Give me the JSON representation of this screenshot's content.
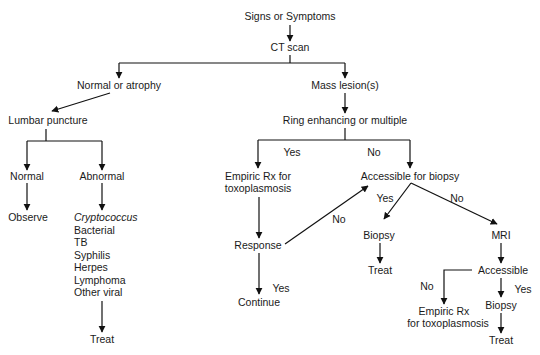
{
  "diagram": {
    "type": "flowchart",
    "nodes": {
      "start": "Signs or Symptoms",
      "ct": "CT scan",
      "normal_atrophy": "Normal or atrophy",
      "mass": "Mass lesion(s)",
      "lp": "Lumbar puncture",
      "lp_normal": "Normal",
      "lp_abnormal": "Abnormal",
      "observe": "Observe",
      "causes": [
        "Cryptococcus",
        "Bacterial",
        "TB",
        "Syphilis",
        "Herpes",
        "Lymphoma",
        "Other viral"
      ],
      "treat_lp": "Treat",
      "ring": "Ring enhancing or multiple",
      "empiric_1_line1": "Empiric Rx for",
      "empiric_1_line2": "toxoplasmosis",
      "accessible_biopsy": "Accessible for biopsy",
      "response": "Response",
      "continue": "Continue",
      "biopsy_1": "Biopsy",
      "treat_1": "Treat",
      "mri": "MRI",
      "accessible": "Accessible",
      "empiric_2_line1": "Empiric Rx",
      "empiric_2_line2": "for toxoplasmosis",
      "biopsy_2": "Biopsy",
      "treat_2": "Treat"
    },
    "edge_labels": {
      "ring_yes": "Yes",
      "ring_no": "No",
      "response_no": "No",
      "response_yes": "Yes",
      "access_yes": "Yes",
      "access_no": "No",
      "mri_access_no": "No",
      "mri_access_yes": "Yes"
    }
  }
}
